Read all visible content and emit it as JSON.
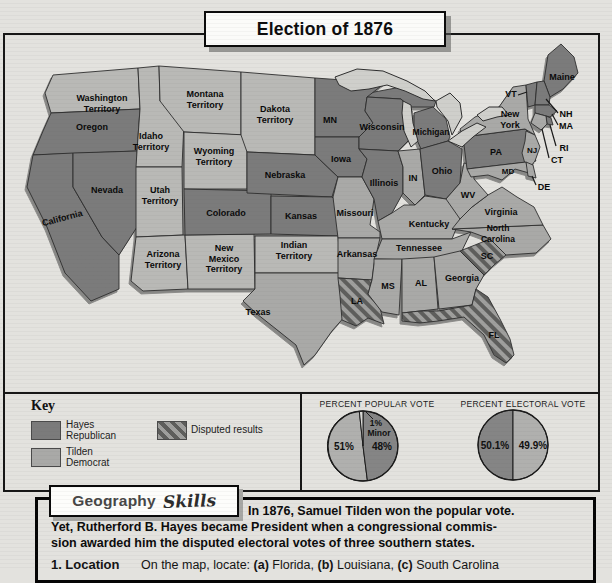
{
  "title": "Election of 1876",
  "map": {
    "states": [
      {
        "id": "washington_territory",
        "name": "Washington\nTerritory",
        "party": "territory"
      },
      {
        "id": "oregon",
        "name": "Oregon",
        "party": "hayes"
      },
      {
        "id": "california",
        "name": "California",
        "party": "hayes"
      },
      {
        "id": "nevada",
        "name": "Nevada",
        "party": "hayes"
      },
      {
        "id": "idaho_territory",
        "name": "Idaho\nTerritory",
        "party": "territory"
      },
      {
        "id": "montana_territory",
        "name": "Montana\nTerritory",
        "party": "territory"
      },
      {
        "id": "wyoming_territory",
        "name": "Wyoming\nTerritory",
        "party": "territory"
      },
      {
        "id": "utah_territory",
        "name": "Utah\nTerritory",
        "party": "territory"
      },
      {
        "id": "arizona_territory",
        "name": "Arizona\nTerritory",
        "party": "territory"
      },
      {
        "id": "new_mexico_territory",
        "name": "New\nMexico\nTerritory",
        "party": "territory"
      },
      {
        "id": "colorado",
        "name": "Colorado",
        "party": "hayes"
      },
      {
        "id": "dakota_territory",
        "name": "Dakota\nTerritory",
        "party": "territory"
      },
      {
        "id": "nebraska",
        "name": "Nebraska",
        "party": "hayes"
      },
      {
        "id": "kansas",
        "name": "Kansas",
        "party": "hayes"
      },
      {
        "id": "indian_territory",
        "name": "Indian\nTerritory",
        "party": "territory"
      },
      {
        "id": "texas",
        "name": "Texas",
        "party": "tilden"
      },
      {
        "id": "minnesota",
        "name": "MN",
        "party": "hayes"
      },
      {
        "id": "iowa",
        "name": "Iowa",
        "party": "hayes"
      },
      {
        "id": "missouri",
        "name": "Missouri",
        "party": "tilden"
      },
      {
        "id": "arkansas",
        "name": "Arkansas",
        "party": "tilden"
      },
      {
        "id": "louisiana",
        "name": "LA",
        "party": "disputed"
      },
      {
        "id": "wisconsin",
        "name": "Wisconsin",
        "party": "hayes"
      },
      {
        "id": "illinois",
        "name": "Illinois",
        "party": "hayes"
      },
      {
        "id": "michigan",
        "name": "Michigan",
        "party": "hayes"
      },
      {
        "id": "indiana",
        "name": "IN",
        "party": "tilden"
      },
      {
        "id": "ohio",
        "name": "Ohio",
        "party": "hayes"
      },
      {
        "id": "kentucky",
        "name": "Kentucky",
        "party": "tilden"
      },
      {
        "id": "tennessee",
        "name": "Tennessee",
        "party": "tilden"
      },
      {
        "id": "mississippi",
        "name": "MS",
        "party": "tilden"
      },
      {
        "id": "alabama",
        "name": "AL",
        "party": "tilden"
      },
      {
        "id": "georgia",
        "name": "Georgia",
        "party": "tilden"
      },
      {
        "id": "florida",
        "name": "FL",
        "party": "disputed"
      },
      {
        "id": "south_carolina",
        "name": "SC",
        "party": "disputed"
      },
      {
        "id": "north_carolina",
        "name": "North\nCarolina",
        "party": "tilden"
      },
      {
        "id": "virginia",
        "name": "Virginia",
        "party": "tilden"
      },
      {
        "id": "west_virginia",
        "name": "WV",
        "party": "tilden"
      },
      {
        "id": "pennsylvania",
        "name": "PA",
        "party": "hayes"
      },
      {
        "id": "new_york",
        "name": "New\nYork",
        "party": "tilden"
      },
      {
        "id": "new_jersey",
        "name": "NJ",
        "party": "tilden"
      },
      {
        "id": "maryland",
        "name": "MD",
        "party": "tilden"
      },
      {
        "id": "delaware",
        "name": "DE",
        "party": "tilden"
      },
      {
        "id": "maine",
        "name": "Maine",
        "party": "hayes"
      },
      {
        "id": "vermont",
        "name": "VT",
        "party": "hayes"
      },
      {
        "id": "new_hampshire",
        "name": "NH",
        "party": "hayes"
      },
      {
        "id": "massachusetts",
        "name": "MA",
        "party": "hayes"
      },
      {
        "id": "rhode_island",
        "name": "RI",
        "party": "hayes"
      },
      {
        "id": "connecticut",
        "name": "CT",
        "party": "tilden"
      }
    ]
  },
  "key": {
    "title": "Key",
    "items": [
      {
        "label": "Hayes\nRepublican",
        "type": "hayes"
      },
      {
        "label": "Tilden\nDemocrat",
        "type": "tilden"
      },
      {
        "label": "Disputed results",
        "type": "disputed"
      }
    ]
  },
  "chart_data": [
    {
      "type": "pie",
      "title": "PERCENT POPULAR VOTE",
      "slices": [
        {
          "label": "51%",
          "value": 51,
          "party": "Tilden Democrat"
        },
        {
          "label": "48%",
          "value": 48,
          "party": "Hayes Republican"
        },
        {
          "label": "1% Minor",
          "value": 1,
          "party": "Minor parties"
        }
      ]
    },
    {
      "type": "pie",
      "title": "PERCENT ELECTORAL VOTE",
      "slices": [
        {
          "label": "50.1%",
          "value": 50.1,
          "party": "Hayes Republican"
        },
        {
          "label": "49.9%",
          "value": 49.9,
          "party": "Tilden Democrat"
        }
      ]
    }
  ],
  "colors": {
    "hayes": "#7b7b7b",
    "tilden": "#a9a9a7",
    "territory": "#b9b9b6",
    "disputed_base": "#9f9f9d",
    "disputed_stripe": "#5e5e5c",
    "pie_dark": "#858585",
    "pie_light": "#b0b0ae",
    "pie_minor": "#d9d9d6"
  },
  "skills": {
    "heading_main": "Geography",
    "heading_script": "Skills",
    "lines": [
      "In 1876, Samuel Tilden won the popular vote.",
      "Yet, Rutherford B. Hayes became President when a congressional commis-",
      "sion awarded him the disputed electoral votes of three southern states."
    ],
    "question": {
      "number": "1.",
      "label": "Location",
      "lead": "On the map, locate:",
      "parts": [
        {
          "bold": "(a)",
          "text": " Florida, "
        },
        {
          "bold": "(b)",
          "text": " Louisiana, "
        },
        {
          "bold": "(c)",
          "text": " South Carolina"
        }
      ]
    }
  }
}
